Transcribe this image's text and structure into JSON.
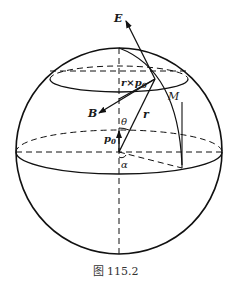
{
  "figure": {
    "caption": "图 115.2",
    "labels": {
      "E": "E",
      "B": "B",
      "M": "M",
      "r": "r",
      "rxp0": "r×p",
      "rxp0_sub": "0",
      "p0": "p",
      "p0_sub": "0",
      "theta": "θ",
      "alpha": "α"
    }
  }
}
